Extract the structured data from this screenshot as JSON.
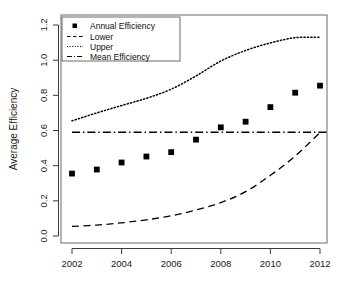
{
  "chart_data": {
    "type": "scatter",
    "title": "",
    "xlabel": "",
    "ylabel": "Average Efficiency",
    "xlim": [
      2001.5,
      2012.6
    ],
    "ylim": [
      0.0,
      1.25
    ],
    "grid": false,
    "legend_position": "top-left",
    "x_ticks": [
      "2002",
      "2004",
      "2006",
      "2008",
      "2010",
      "2012"
    ],
    "x_tick_values": [
      2002,
      2004,
      2006,
      2008,
      2010,
      2012
    ],
    "y_ticks": [
      "0.0",
      "0.2",
      "0.4",
      "0.6",
      "0.8",
      "1.0",
      "1.2"
    ],
    "y_tick_values": [
      0.0,
      0.2,
      0.4,
      0.6,
      0.8,
      1.0,
      1.2
    ],
    "x": [
      2002,
      2003,
      2004,
      2005,
      2006,
      2007,
      2008,
      2009,
      2010,
      2011,
      2012
    ],
    "series": [
      {
        "name": "Annual Efficiency",
        "style": "points",
        "marker": "filled-square",
        "values": [
          0.355,
          0.378,
          0.418,
          0.452,
          0.477,
          0.548,
          0.618,
          0.65,
          0.733,
          0.815,
          0.855
        ]
      },
      {
        "name": "Lower",
        "style": "dashed",
        "values": [
          0.055,
          0.062,
          0.075,
          0.092,
          0.115,
          0.148,
          0.19,
          0.252,
          0.345,
          0.455,
          0.588
        ]
      },
      {
        "name": "Upper",
        "style": "dotted",
        "values": [
          0.655,
          0.7,
          0.742,
          0.783,
          0.835,
          0.91,
          0.995,
          1.055,
          1.098,
          1.128,
          1.13
        ]
      },
      {
        "name": "Mean Efficiency",
        "style": "dash-dot",
        "constant": 0.59,
        "values": [
          0.59,
          0.59,
          0.59,
          0.59,
          0.59,
          0.59,
          0.59,
          0.59,
          0.59,
          0.59,
          0.59
        ]
      }
    ]
  },
  "legend": {
    "entries": [
      {
        "label": "Annual Efficiency",
        "style": "filled-square"
      },
      {
        "label": "Lower",
        "style": "dashed"
      },
      {
        "label": "Upper",
        "style": "dotted"
      },
      {
        "label": "Mean Efficiency",
        "style": "dash-dot"
      }
    ]
  },
  "colors": {
    "foreground": "#000000",
    "background": "#ffffff",
    "axis": "#3a3a3a"
  }
}
